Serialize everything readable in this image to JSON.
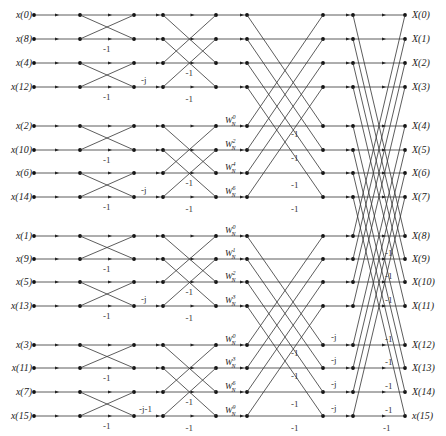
{
  "diagram": {
    "type": "16-point radix-2 DIT FFT butterfly flow graph",
    "inputs": [
      "x(0)",
      "x(8)",
      "x(4)",
      "x(12)",
      "x(2)",
      "x(10)",
      "x(6)",
      "x(14)",
      "x(1)",
      "x(9)",
      "x(5)",
      "x(13)",
      "x(3)",
      "x(11)",
      "x(7)",
      "x(15)"
    ],
    "outputs": [
      "X(0)",
      "X(1)",
      "X(2)",
      "X(3)",
      "X(4)",
      "X(5)",
      "X(6)",
      "X(7)",
      "X(8)",
      "X(9)",
      "X(10)",
      "X(11)",
      "X(12)",
      "X(13)",
      "X(14)",
      "x(15)"
    ],
    "stage1_minus_labels": "-1",
    "stage2_j_label": "-j",
    "stage2_jm1_label": "-j-1",
    "stage3_twiddles": [
      {
        "row": 4,
        "exp": "0"
      },
      {
        "row": 5,
        "exp": "2"
      },
      {
        "row": 6,
        "exp": "4"
      },
      {
        "row": 7,
        "exp": "6"
      },
      {
        "row": 8,
        "exp": "0"
      },
      {
        "row": 9,
        "exp": "1"
      },
      {
        "row": 10,
        "exp": "2"
      },
      {
        "row": 11,
        "exp": "3"
      },
      {
        "row": 12,
        "exp": "0"
      },
      {
        "row": 13,
        "exp": "3"
      },
      {
        "row": 14,
        "exp": "6"
      },
      {
        "row": 15,
        "exp": "9"
      }
    ],
    "twiddle_base": "W",
    "twiddle_sub": "N",
    "stage4_j_label": "-j",
    "minus_one": "-1"
  }
}
